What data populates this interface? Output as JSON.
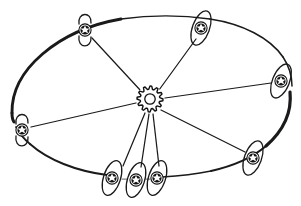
{
  "figure": {
    "style": "hand-drawn line art",
    "background_color": "#ffffff",
    "ink_color": "#1a1a1a",
    "canvas": {
      "width": 301,
      "height": 206
    }
  },
  "hub": {
    "name": "central-gear-hub",
    "icon": "gear-icon",
    "label": "",
    "cx": 150,
    "cy": 99,
    "outer_radius": 13,
    "inner_hole_radius": 5.2,
    "teeth": 12
  },
  "ring": {
    "name": "outer-ellipse-ring",
    "cx": 150,
    "cy": 99,
    "rx": 141,
    "ry": 83,
    "rotation_deg": 0,
    "stroke_weight_min": 1.2,
    "stroke_weight_max": 3.4,
    "description": "Large perspective ellipse drawn with varying pressure, heaviest at left and right extremes"
  },
  "nodes": [
    {
      "id": "node-top-left",
      "name": "node-top-left",
      "icon": "atom-node-icon",
      "cx": 85,
      "cy": 30,
      "orbit_rx": 8,
      "orbit_ry": 17,
      "orbit_rotation_deg": 88,
      "core_radius": 6.2,
      "orbit_style": "open"
    },
    {
      "id": "node-top-right",
      "name": "node-top-right",
      "icon": "atom-node-icon",
      "cx": 201,
      "cy": 28,
      "orbit_rx": 8.5,
      "orbit_ry": 18,
      "orbit_rotation_deg": 20,
      "core_radius": 6.2,
      "orbit_style": "closed"
    },
    {
      "id": "node-right",
      "name": "node-right",
      "icon": "atom-node-icon",
      "cx": 281,
      "cy": 81,
      "orbit_rx": 8.5,
      "orbit_ry": 18,
      "orbit_rotation_deg": 22,
      "core_radius": 6.2,
      "orbit_style": "closed"
    },
    {
      "id": "node-bottom-right",
      "name": "node-bottom-right",
      "icon": "atom-node-icon",
      "cx": 253,
      "cy": 158,
      "orbit_rx": 8.5,
      "orbit_ry": 18,
      "orbit_rotation_deg": 20,
      "core_radius": 6.2,
      "orbit_style": "closed"
    },
    {
      "id": "node-bottom-c",
      "name": "node-bottom-right-cluster",
      "icon": "atom-node-icon",
      "cx": 157,
      "cy": 178,
      "orbit_rx": 8.5,
      "orbit_ry": 18,
      "orbit_rotation_deg": 18,
      "core_radius": 6.2,
      "orbit_style": "closed"
    },
    {
      "id": "node-bottom-b",
      "name": "node-bottom-center-cluster",
      "icon": "atom-node-icon",
      "cx": 136,
      "cy": 180,
      "orbit_rx": 8.5,
      "orbit_ry": 18,
      "orbit_rotation_deg": 18,
      "core_radius": 6.2,
      "orbit_style": "closed"
    },
    {
      "id": "node-bottom-a",
      "name": "node-bottom-left-cluster",
      "icon": "atom-node-icon",
      "cx": 112,
      "cy": 178,
      "orbit_rx": 8.5,
      "orbit_ry": 18,
      "orbit_rotation_deg": 18,
      "core_radius": 6.2,
      "orbit_style": "closed"
    },
    {
      "id": "node-left",
      "name": "node-left",
      "icon": "atom-node-icon",
      "cx": 22,
      "cy": 130,
      "orbit_rx": 8,
      "orbit_ry": 17,
      "orbit_rotation_deg": 92,
      "core_radius": 6.2,
      "orbit_style": "open"
    }
  ],
  "spokes": [
    {
      "id": "spoke-top-left",
      "name": "spoke-hub-to-node-top-left",
      "from": "hub",
      "to": "node-top-left"
    },
    {
      "id": "spoke-top-right",
      "name": "spoke-hub-to-node-top-right",
      "from": "hub",
      "to": "node-top-right"
    },
    {
      "id": "spoke-right",
      "name": "spoke-hub-to-node-right",
      "from": "hub",
      "to": "node-right"
    },
    {
      "id": "spoke-bottom-right",
      "name": "spoke-hub-to-node-bottom-right",
      "from": "hub",
      "to": "node-bottom-right"
    },
    {
      "id": "spoke-bottom-c",
      "name": "spoke-hub-to-node-bottom-c",
      "from": "hub",
      "to": "node-bottom-c"
    },
    {
      "id": "spoke-bottom-b",
      "name": "spoke-hub-to-node-bottom-b",
      "from": "hub",
      "to": "node-bottom-b"
    },
    {
      "id": "spoke-bottom-a",
      "name": "spoke-hub-to-node-bottom-a",
      "from": "hub",
      "to": "node-bottom-a"
    },
    {
      "id": "spoke-left",
      "name": "spoke-hub-to-node-left",
      "from": "hub",
      "to": "node-left"
    }
  ],
  "counts": {
    "node_count": 8,
    "spoke_count": 8,
    "hub_count": 1
  }
}
